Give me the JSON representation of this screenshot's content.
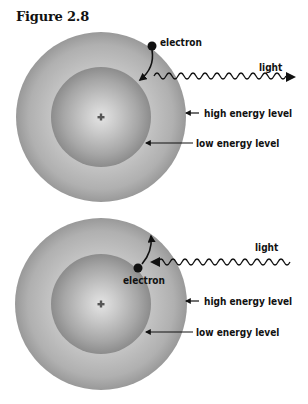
{
  "figure": {
    "title": "Figure 2.8"
  },
  "panels": [
    {
      "id": "emission",
      "electron_label": "electron",
      "light_label": "light",
      "high_level_label": "high energy level",
      "low_level_label": "low energy level",
      "nucleus_symbol": "+",
      "electron_transition": "high-to-low",
      "light_direction": "outgoing"
    },
    {
      "id": "absorption",
      "electron_label": "electron",
      "light_label": "light",
      "high_level_label": "high energy level",
      "low_level_label": "low energy level",
      "nucleus_symbol": "+",
      "electron_transition": "low-to-high",
      "light_direction": "incoming"
    }
  ],
  "colors": {
    "outer_shell": "#9a9a9a",
    "inner_shell": "#8e8e8e",
    "center_glow": "#e6e6e6",
    "ink": "#111111"
  }
}
